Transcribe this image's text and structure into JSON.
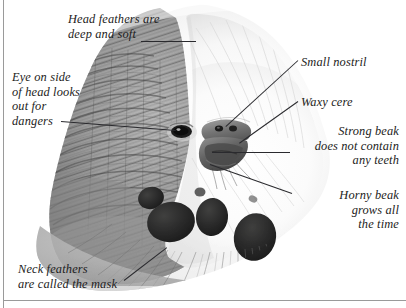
{
  "figure": {
    "background_color": "#ffffff",
    "ink_color": "#1d1d22",
    "rule_color": "#9a9a9a",
    "leader_color": "#2a2a2e"
  },
  "annotations": [
    {
      "id": "head-feathers",
      "lines": [
        "Head feathers are",
        "deep and soft"
      ],
      "align": "left",
      "x": 68,
      "y": 12,
      "width": 130
    },
    {
      "id": "eye-on-side",
      "lines": [
        "Eye on side",
        "of head looks",
        "out for",
        "dangers"
      ],
      "align": "left",
      "x": 12,
      "y": 70,
      "width": 96
    },
    {
      "id": "small-nostril",
      "lines": [
        "Small nostril"
      ],
      "align": "left",
      "x": 301,
      "y": 55,
      "width": 100
    },
    {
      "id": "waxy-cere",
      "lines": [
        "Waxy cere"
      ],
      "align": "left",
      "x": 301,
      "y": 95,
      "width": 100
    },
    {
      "id": "strong-beak",
      "lines": [
        "Strong beak",
        "does not contain",
        "any teeth"
      ],
      "align": "right",
      "x": 281,
      "y": 124,
      "width": 118
    },
    {
      "id": "horny-beak",
      "lines": [
        "Horny beak",
        "grows all",
        "the time"
      ],
      "align": "right",
      "x": 281,
      "y": 188,
      "width": 118
    },
    {
      "id": "neck-feathers",
      "lines": [
        "Neck feathers",
        "are called the mask"
      ],
      "align": "left",
      "x": 18,
      "y": 262,
      "width": 135
    }
  ],
  "leaders": [
    {
      "id": "leader-head-feathers",
      "x1": 141,
      "y1": 41,
      "x2": 196,
      "y2": 41
    },
    {
      "id": "leader-eye",
      "x1": 61,
      "y1": 121,
      "x2": 176,
      "y2": 130
    },
    {
      "id": "leader-small-nostril",
      "x1": 298,
      "y1": 60,
      "x2": 226,
      "y2": 126
    },
    {
      "id": "leader-waxy-cere",
      "x1": 298,
      "y1": 101,
      "x2": 239,
      "y2": 143
    },
    {
      "id": "leader-strong-beak",
      "x1": 290,
      "y1": 152,
      "x2": 212,
      "y2": 152
    },
    {
      "id": "leader-horny-beak",
      "x1": 292,
      "y1": 193,
      "x2": 210,
      "y2": 164
    },
    {
      "id": "leader-neck-feathers",
      "x1": 124,
      "y1": 280,
      "x2": 167,
      "y2": 247
    }
  ]
}
